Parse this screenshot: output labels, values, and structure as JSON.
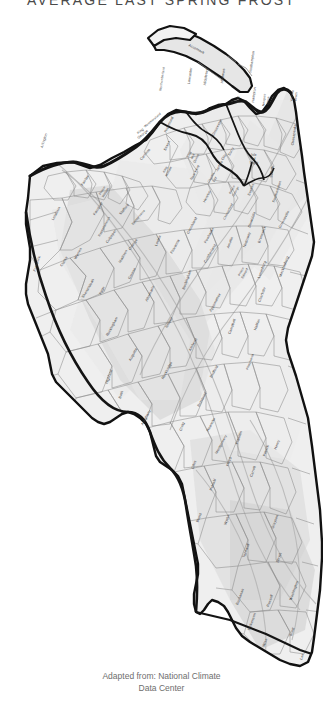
{
  "title": "Average Last Spring Frost",
  "caption": {
    "line1": "Adapted from: National Climate",
    "line2": "Data Center"
  },
  "colors": {
    "background": "#ffffff",
    "state_outline": "#111111",
    "county_line": "#7a7a7a",
    "band_light": "#ededed",
    "band_mid": "#dcdcdc",
    "band_dark": "#c9c9c9",
    "label_text": "#3c3c3c",
    "caption_text": "#6e6e6e",
    "title_text": "#4a4a4a"
  },
  "map": {
    "region": "Virginia",
    "counties": [
      {
        "name": "Accomack",
        "x": 196,
        "y": 50,
        "rot": 28
      },
      {
        "name": "Northampton",
        "x": 253,
        "y": 62,
        "rot": -82
      },
      {
        "name": "Virginia Beach",
        "x": 293,
        "y": 96,
        "rot": -82
      },
      {
        "name": "Chesapeake",
        "x": 295,
        "y": 135,
        "rot": -82
      },
      {
        "name": "Suffolk",
        "x": 273,
        "y": 172,
        "rot": -82
      },
      {
        "name": "Isle of Wight",
        "x": 254,
        "y": 156,
        "rot": 0
      },
      {
        "name": "Hampton",
        "x": 255,
        "y": 95,
        "rot": -82
      },
      {
        "name": "Newport News",
        "x": 265,
        "y": 100,
        "rot": -82
      },
      {
        "name": "York",
        "x": 239,
        "y": 100,
        "rot": -82
      },
      {
        "name": "Mathews",
        "x": 224,
        "y": 76,
        "rot": -82
      },
      {
        "name": "Middlesex",
        "x": 207,
        "y": 77,
        "rot": -82
      },
      {
        "name": "Lancaster",
        "x": 191,
        "y": 76,
        "rot": -82
      },
      {
        "name": "Northumberland",
        "x": 163,
        "y": 79,
        "rot": -82
      },
      {
        "name": "Westmoreland",
        "x": 153,
        "y": 121,
        "rot": -40
      },
      {
        "name": "Richmond",
        "x": 170,
        "y": 125,
        "rot": -65
      },
      {
        "name": "Essex",
        "x": 168,
        "y": 146,
        "rot": -65
      },
      {
        "name": "King George",
        "x": 141,
        "y": 132,
        "rot": -38
      },
      {
        "name": "Caroline",
        "x": 146,
        "y": 155,
        "rot": -50
      },
      {
        "name": "King William",
        "x": 166,
        "y": 170,
        "rot": -62
      },
      {
        "name": "King and Queen",
        "x": 190,
        "y": 155,
        "rot": -62
      },
      {
        "name": "Gloucester",
        "x": 218,
        "y": 128,
        "rot": -62
      },
      {
        "name": "New Kent",
        "x": 196,
        "y": 173,
        "rot": -62
      },
      {
        "name": "Charles City",
        "x": 212,
        "y": 178,
        "rot": -62
      },
      {
        "name": "James City",
        "x": 222,
        "y": 163,
        "rot": -62
      },
      {
        "name": "Surry",
        "x": 232,
        "y": 152,
        "rot": -62
      },
      {
        "name": "Prince George",
        "x": 233,
        "y": 190,
        "rot": -62
      },
      {
        "name": "Sussex",
        "x": 252,
        "y": 190,
        "rot": -70
      },
      {
        "name": "Southampton",
        "x": 278,
        "y": 192,
        "rot": -72
      },
      {
        "name": "Greensville",
        "x": 285,
        "y": 220,
        "rot": -62
      },
      {
        "name": "Brunswick",
        "x": 263,
        "y": 235,
        "rot": -70
      },
      {
        "name": "Mecklenburg",
        "x": 285,
        "y": 267,
        "rot": -70
      },
      {
        "name": "Lunenburg",
        "x": 263,
        "y": 270,
        "rot": -70
      },
      {
        "name": "Nottoway",
        "x": 248,
        "y": 240,
        "rot": -70
      },
      {
        "name": "Dinwiddie",
        "x": 253,
        "y": 220,
        "rot": -70
      },
      {
        "name": "Chesterfield",
        "x": 229,
        "y": 212,
        "rot": -62
      },
      {
        "name": "Henrico",
        "x": 208,
        "y": 197,
        "rot": -62
      },
      {
        "name": "Amelia",
        "x": 231,
        "y": 243,
        "rot": -70
      },
      {
        "name": "Powhatan",
        "x": 210,
        "y": 236,
        "rot": -62
      },
      {
        "name": "Goochland",
        "x": 193,
        "y": 226,
        "rot": -62
      },
      {
        "name": "Cumberland",
        "x": 211,
        "y": 254,
        "rot": -60
      },
      {
        "name": "Prince Edward",
        "x": 242,
        "y": 272,
        "rot": -62
      },
      {
        "name": "Charlotte",
        "x": 263,
        "y": 295,
        "rot": -70
      },
      {
        "name": "Halifax",
        "x": 258,
        "y": 325,
        "rot": -70
      },
      {
        "name": "Pittsylvania",
        "x": 251,
        "y": 362,
        "rot": -70
      },
      {
        "name": "Campbell",
        "x": 233,
        "y": 327,
        "rot": -70
      },
      {
        "name": "Appomattox",
        "x": 216,
        "y": 303,
        "rot": -62
      },
      {
        "name": "Buckingham",
        "x": 188,
        "y": 280,
        "rot": -70
      },
      {
        "name": "Fluvanna",
        "x": 176,
        "y": 247,
        "rot": -62
      },
      {
        "name": "Louisa",
        "x": 159,
        "y": 241,
        "rot": -70
      },
      {
        "name": "Orange",
        "x": 134,
        "y": 245,
        "rot": -55
      },
      {
        "name": "Spotsylvania",
        "x": 139,
        "y": 218,
        "rot": -50
      },
      {
        "name": "Albemarle",
        "x": 151,
        "y": 294,
        "rot": -65
      },
      {
        "name": "Greene",
        "x": 133,
        "y": 274,
        "rot": -62
      },
      {
        "name": "Madison",
        "x": 124,
        "y": 257,
        "rot": -60
      },
      {
        "name": "Culpeper",
        "x": 112,
        "y": 237,
        "rot": -55
      },
      {
        "name": "Rappahannock",
        "x": 105,
        "y": 227,
        "rot": -62
      },
      {
        "name": "Fauquier",
        "x": 99,
        "y": 209,
        "rot": -58
      },
      {
        "name": "Stafford",
        "x": 125,
        "y": 210,
        "rot": -50
      },
      {
        "name": "Prince William",
        "x": 103,
        "y": 191,
        "rot": -58
      },
      {
        "name": "Fairfax",
        "x": 86,
        "y": 181,
        "rot": -58
      },
      {
        "name": "Arlington",
        "x": 45,
        "y": 141,
        "rot": -72
      },
      {
        "name": "Loudoun",
        "x": 57,
        "y": 214,
        "rot": -62
      },
      {
        "name": "Clarke",
        "x": 65,
        "y": 262,
        "rot": -58
      },
      {
        "name": "Frederick",
        "x": 38,
        "y": 264,
        "rot": -72
      },
      {
        "name": "Warren",
        "x": 79,
        "y": 254,
        "rot": -62
      },
      {
        "name": "Shenandoah",
        "x": 89,
        "y": 289,
        "rot": -60
      },
      {
        "name": "Page",
        "x": 103,
        "y": 291,
        "rot": -62
      },
      {
        "name": "Rockingham",
        "x": 113,
        "y": 327,
        "rot": -62
      },
      {
        "name": "Augusta",
        "x": 134,
        "y": 355,
        "rot": -62
      },
      {
        "name": "Highland",
        "x": 110,
        "y": 377,
        "rot": -70
      },
      {
        "name": "Bath",
        "x": 122,
        "y": 395,
        "rot": -70
      },
      {
        "name": "Rockbridge",
        "x": 168,
        "y": 371,
        "rot": -62
      },
      {
        "name": "Nelson",
        "x": 170,
        "y": 323,
        "rot": -62
      },
      {
        "name": "Amherst",
        "x": 194,
        "y": 345,
        "rot": -62
      },
      {
        "name": "Bedford",
        "x": 215,
        "y": 372,
        "rot": -62
      },
      {
        "name": "Alleghany",
        "x": 147,
        "y": 418,
        "rot": -62
      },
      {
        "name": "Botetourt",
        "x": 203,
        "y": 400,
        "rot": -62
      },
      {
        "name": "Craig",
        "x": 183,
        "y": 427,
        "rot": -70
      },
      {
        "name": "Roanoke",
        "x": 212,
        "y": 425,
        "rot": -62
      },
      {
        "name": "Franklin",
        "x": 240,
        "y": 438,
        "rot": -70
      },
      {
        "name": "Montgomery",
        "x": 222,
        "y": 445,
        "rot": -62
      },
      {
        "name": "Floyd",
        "x": 230,
        "y": 462,
        "rot": -70
      },
      {
        "name": "Giles",
        "x": 195,
        "y": 465,
        "rot": -70
      },
      {
        "name": "Pulaski",
        "x": 214,
        "y": 485,
        "rot": -70
      },
      {
        "name": "Patrick",
        "x": 267,
        "y": 451,
        "rot": -70
      },
      {
        "name": "Henry",
        "x": 278,
        "y": 445,
        "rot": -70
      },
      {
        "name": "Carroll",
        "x": 254,
        "y": 472,
        "rot": -70
      },
      {
        "name": "Bland",
        "x": 200,
        "y": 518,
        "rot": -70
      },
      {
        "name": "Wythe",
        "x": 228,
        "y": 520,
        "rot": -70
      },
      {
        "name": "Grayson",
        "x": 276,
        "y": 522,
        "rot": -70
      },
      {
        "name": "Tazewell",
        "x": 247,
        "y": 551,
        "rot": -70
      },
      {
        "name": "Smyth",
        "x": 280,
        "y": 558,
        "rot": -70
      },
      {
        "name": "Buchanan",
        "x": 241,
        "y": 597,
        "rot": -70
      },
      {
        "name": "Russell",
        "x": 271,
        "y": 601,
        "rot": -70
      },
      {
        "name": "Washington",
        "x": 295,
        "y": 591,
        "rot": -70
      },
      {
        "name": "Dickenson",
        "x": 253,
        "y": 622,
        "rot": -70
      },
      {
        "name": "Wise",
        "x": 266,
        "y": 643,
        "rot": -70
      },
      {
        "name": "Scott",
        "x": 293,
        "y": 632,
        "rot": -70
      },
      {
        "name": "Lee",
        "x": 303,
        "y": 657,
        "rot": -70
      }
    ]
  }
}
